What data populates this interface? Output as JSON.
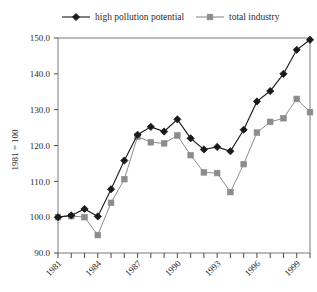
{
  "chart_data": {
    "type": "line",
    "title": "",
    "subtitle": "",
    "xlabel": "",
    "ylabel": "1981 = 100",
    "xlim": [
      1981,
      2000
    ],
    "ylim": [
      90.0,
      150.0
    ],
    "grid": false,
    "legend_position": "top",
    "x": [
      1981,
      1982,
      1983,
      1984,
      1985,
      1986,
      1987,
      1988,
      1989,
      1990,
      1991,
      1992,
      1993,
      1994,
      1995,
      1996,
      1997,
      1998,
      1999,
      2000
    ],
    "xtick_labels": [
      "1981",
      "1984",
      "1987",
      "1990",
      "1993",
      "1996",
      "1999"
    ],
    "xticks": [
      1981,
      1984,
      1987,
      1990,
      1993,
      1996,
      1999
    ],
    "ytick_labels": [
      "90.0",
      "100.0",
      "110.0",
      "120.0",
      "130.0",
      "140.0",
      "150.0"
    ],
    "yticks": [
      90.0,
      100.0,
      110.0,
      120.0,
      130.0,
      140.0,
      150.0
    ],
    "series": [
      {
        "name": "high pollution potential",
        "color": "#1a1a1a",
        "marker": "diamond",
        "values": [
          100.0,
          100.5,
          102.3,
          100.2,
          107.8,
          115.8,
          123.0,
          125.2,
          123.9,
          127.3,
          122.0,
          118.9,
          119.6,
          118.4,
          124.4,
          132.3,
          135.2,
          140.0,
          146.7,
          149.5
        ]
      },
      {
        "name": "total industry",
        "color": "#8c8c8c",
        "marker": "square",
        "values": [
          100.0,
          100.3,
          100.0,
          95.0,
          104.0,
          110.6,
          122.5,
          120.9,
          120.6,
          122.8,
          117.3,
          112.5,
          112.3,
          107.0,
          114.8,
          123.6,
          126.6,
          127.6,
          133.0,
          129.3
        ]
      }
    ]
  },
  "legend": {
    "entries": [
      {
        "label": "high pollution potential",
        "marker": "diamond-marker",
        "color": "#1a1a1a"
      },
      {
        "label": "total industry",
        "marker": "square-marker",
        "color": "#8c8c8c"
      }
    ]
  },
  "axes": {
    "y_axis_title": "1981 = 100"
  }
}
